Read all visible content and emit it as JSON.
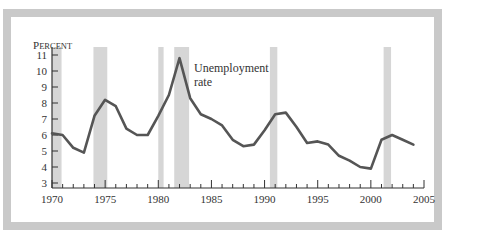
{
  "chart_data": {
    "type": "line",
    "title": "",
    "ylabel": "Percent",
    "xlabel": "",
    "ylim": [
      3,
      11
    ],
    "xlim": [
      1970,
      2005
    ],
    "y_ticks": [
      3,
      4,
      5,
      6,
      7,
      8,
      9,
      10,
      11
    ],
    "x_tick_labels": [
      1970,
      1975,
      1980,
      1985,
      1990,
      1995,
      2000,
      2005
    ],
    "grid": false,
    "legend": "none",
    "annotations": [
      {
        "text": "Unemployment rate",
        "x": 1983,
        "y": 10.2
      }
    ],
    "shaded_recessions": [
      [
        1970.0,
        1970.9
      ],
      [
        1973.9,
        1975.2
      ],
      [
        1980.0,
        1980.5
      ],
      [
        1981.5,
        1982.9
      ],
      [
        1990.5,
        1991.2
      ],
      [
        2001.2,
        2001.9
      ]
    ],
    "series": [
      {
        "name": "Unemployment rate",
        "x": [
          1970,
          1971,
          1972,
          1973,
          1974,
          1975,
          1976,
          1977,
          1978,
          1979,
          1980,
          1981,
          1982,
          1983,
          1984,
          1985,
          1986,
          1987,
          1988,
          1989,
          1990,
          1991,
          1992,
          1993,
          1994,
          1995,
          1996,
          1997,
          1998,
          1999,
          2000,
          2001,
          2002,
          2003,
          2004
        ],
        "values": [
          6.1,
          6.0,
          5.2,
          4.9,
          7.2,
          8.2,
          7.8,
          6.4,
          6.0,
          6.0,
          7.2,
          8.5,
          10.8,
          8.3,
          7.3,
          7.0,
          6.6,
          5.7,
          5.3,
          5.4,
          6.3,
          7.3,
          7.4,
          6.5,
          5.5,
          5.6,
          5.4,
          4.7,
          4.4,
          4.0,
          3.9,
          5.7,
          6.0,
          5.7,
          5.4
        ]
      }
    ]
  },
  "labels": {
    "ylabel_first": "P",
    "ylabel_rest": "ERCENT",
    "annotation_line1": "Unemployment",
    "annotation_line2": "rate"
  },
  "colors": {
    "line": "#555555",
    "recession": "#d6d6d6",
    "frame": "#c9c9c9",
    "axis": "#333333"
  }
}
